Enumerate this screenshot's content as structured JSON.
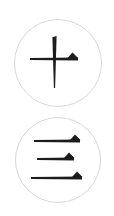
{
  "canvas": {
    "width": 114,
    "height": 216,
    "background_color": "#ffffff"
  },
  "palette": {
    "stroke_color": "#1c1c1c",
    "circle_border_color": "#d8d8d8",
    "background_color": "#ffffff"
  },
  "badges": [
    {
      "id": "badge-cross-stroke",
      "label": "Cross stroke glyph badge",
      "glyph_name": "cross-stroke-glyph",
      "glyph_character": "十",
      "glyph_description": "Vertical stroke crossed by a horizontal stroke, with a small filled triangular flag on the right arm",
      "center_x": 58,
      "center_y": 63,
      "radius": 44,
      "border_width": 1,
      "border_color": "#d8d8d8",
      "stroke_color": "#1c1c1c",
      "strokes": [
        {
          "name": "vertical-stroke",
          "type": "vertical",
          "x": 54.5,
          "y_start": 36,
          "y_end": 88,
          "width_top": 4.2,
          "width_bottom": 1.2
        },
        {
          "name": "horizontal-stroke",
          "type": "horizontal",
          "x_start": 30,
          "x_end": 78,
          "y": 59,
          "width_left": 2.2,
          "width_right": 3.0
        }
      ],
      "flags": [
        {
          "name": "triangle-flag",
          "apex_x": 72.5,
          "apex_y": 52.5,
          "base_left_x": 67.5,
          "base_right_x": 78.0,
          "base_y": 58.0
        }
      ]
    },
    {
      "id": "badge-three-lines",
      "label": "Three horizontal strokes glyph badge",
      "glyph_name": "three-lines-glyph",
      "glyph_character": "三",
      "glyph_description": "Three stacked horizontal strokes, each ending in a small filled triangular flag on the right",
      "center_x": 58,
      "center_y": 160,
      "radius": 43,
      "border_width": 1,
      "border_color": "#d8d8d8",
      "stroke_color": "#1c1c1c",
      "strokes": [
        {
          "name": "top-stroke",
          "type": "horizontal",
          "x_start": 34,
          "x_end": 80,
          "y": 141,
          "width_left": 1.8,
          "width_right": 2.8
        },
        {
          "name": "middle-stroke",
          "type": "horizontal",
          "x_start": 37,
          "x_end": 74,
          "y": 159,
          "width_left": 1.8,
          "width_right": 2.8
        },
        {
          "name": "bottom-stroke",
          "type": "horizontal",
          "x_start": 31,
          "x_end": 82,
          "y": 178,
          "width_left": 1.8,
          "width_right": 2.8
        }
      ],
      "flags": [
        {
          "name": "top-triangle-flag",
          "apex_x": 75.0,
          "apex_y": 134.5,
          "base_left_x": 70.0,
          "base_right_x": 80.5,
          "base_y": 140.0
        },
        {
          "name": "middle-triangle-flag",
          "apex_x": 69.0,
          "apex_y": 152.5,
          "base_left_x": 64.0,
          "base_right_x": 74.5,
          "base_y": 158.0
        },
        {
          "name": "bottom-triangle-flag",
          "apex_x": 77.0,
          "apex_y": 171.5,
          "base_left_x": 72.0,
          "base_right_x": 82.5,
          "base_y": 177.0
        }
      ]
    }
  ]
}
